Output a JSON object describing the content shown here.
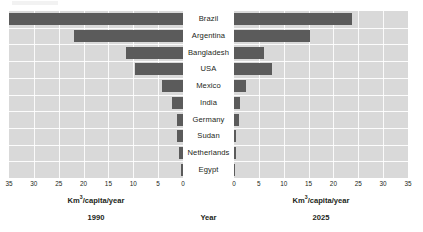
{
  "chart_data": {
    "type": "bar",
    "title": "",
    "subtitle": "",
    "orientation": "horizontal",
    "layout": "bidirectional-tornado",
    "grid": true,
    "legend_position": "none",
    "categories": [
      "Brazil",
      "Argentina",
      "Bangladesh",
      "USA",
      "Mexico",
      "India",
      "Germany",
      "Sudan",
      "Netherlands",
      "Egypt"
    ],
    "xlabel": "Km³/capita/year",
    "ylabel": "",
    "center_axis_label": "Year",
    "xlim": [
      0,
      35
    ],
    "xticks": [
      0,
      5,
      10,
      15,
      20,
      25,
      30,
      35
    ],
    "left_xticks_order": [
      35,
      30,
      25,
      20,
      15,
      10,
      5,
      0
    ],
    "right_xticks_order": [
      0,
      5,
      10,
      15,
      20,
      25,
      30,
      35
    ],
    "series": [
      {
        "name": "1990",
        "side": "left",
        "axis_title": "Km³/capita/year",
        "values": [
          35,
          22,
          11.5,
          9.7,
          4.2,
          2.2,
          1.3,
          1.3,
          0.8,
          0.4
        ]
      },
      {
        "name": "2025",
        "side": "right",
        "axis_title": "Km³/capita/year",
        "values": [
          23.7,
          15.3,
          6.0,
          7.7,
          2.4,
          1.2,
          1.1,
          0.4,
          0.4,
          0.3
        ]
      }
    ],
    "colors": {
      "bar": "#5b5b5b",
      "plot_background": "#d9d9d9",
      "gridline": "#ffffff",
      "text": "#231f20",
      "page_background": "#ffffff"
    }
  },
  "axes": {
    "left": {
      "year": "1990",
      "unit_prefix": "Km",
      "unit_exponent": "3",
      "unit_suffix": "/capita/year",
      "ticks": [
        "35",
        "30",
        "25",
        "20",
        "15",
        "10",
        "5",
        "0"
      ]
    },
    "right": {
      "year": "2025",
      "unit_prefix": "Km",
      "unit_exponent": "3",
      "unit_suffix": "/capita/year",
      "ticks": [
        "0",
        "5",
        "10",
        "15",
        "20",
        "25",
        "30",
        "35"
      ]
    },
    "center": {
      "label": "Year"
    }
  },
  "countries": [
    {
      "label": "Brazil"
    },
    {
      "label": "Argentina"
    },
    {
      "label": "Bangladesh"
    },
    {
      "label": "USA"
    },
    {
      "label": "Mexico"
    },
    {
      "label": "India"
    },
    {
      "label": "Germany"
    },
    {
      "label": "Sudan"
    },
    {
      "label": "Netherlands"
    },
    {
      "label": "Egypt"
    }
  ]
}
